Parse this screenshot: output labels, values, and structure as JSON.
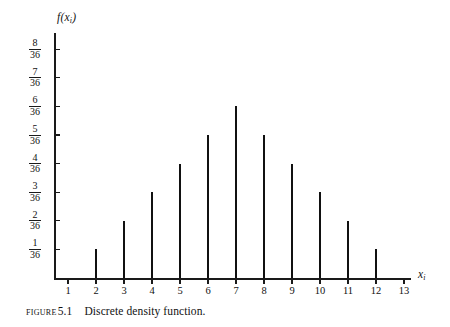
{
  "figure": {
    "caption_label": "Figure",
    "caption_number": "5.1",
    "caption_text": "Discrete density function."
  },
  "chart_data": {
    "type": "bar",
    "title": "",
    "subtitle": "",
    "xlabel": "x",
    "xlabel_sub": "i",
    "ylabel": "f(x",
    "ylabel_sub": "i",
    "ylabel_close": ")",
    "grid": false,
    "legend": "none",
    "xlim": [
      1,
      13
    ],
    "ylim": [
      0,
      8
    ],
    "y_denominator": 36,
    "x_ticks": [
      "1",
      "2",
      "3",
      "4",
      "5",
      "6",
      "7",
      "8",
      "9",
      "10",
      "11",
      "12",
      "13"
    ],
    "x_tick_values": [
      1,
      2,
      3,
      4,
      5,
      6,
      7,
      8,
      9,
      10,
      11,
      12,
      13
    ],
    "y_ticks": [
      {
        "num": "1",
        "den": "36",
        "value": 1
      },
      {
        "num": "2",
        "den": "36",
        "value": 2
      },
      {
        "num": "3",
        "den": "36",
        "value": 3
      },
      {
        "num": "4",
        "den": "36",
        "value": 4
      },
      {
        "num": "5",
        "den": "36",
        "value": 5
      },
      {
        "num": "6",
        "den": "36",
        "value": 6
      },
      {
        "num": "7",
        "den": "36",
        "value": 7
      },
      {
        "num": "8",
        "den": "36",
        "value": 8
      }
    ],
    "categories": [
      2,
      3,
      4,
      5,
      6,
      7,
      8,
      9,
      10,
      11,
      12
    ],
    "values": [
      1,
      2,
      3,
      4,
      5,
      6,
      5,
      4,
      3,
      2,
      1
    ],
    "value_labels": [
      "1/36",
      "2/36",
      "3/36",
      "4/36",
      "5/36",
      "6/36",
      "5/36",
      "4/36",
      "3/36",
      "2/36",
      "1/36"
    ],
    "colors": {
      "axis": "#1a1a1a",
      "bar": "#111111",
      "background": "#ffffff"
    }
  }
}
